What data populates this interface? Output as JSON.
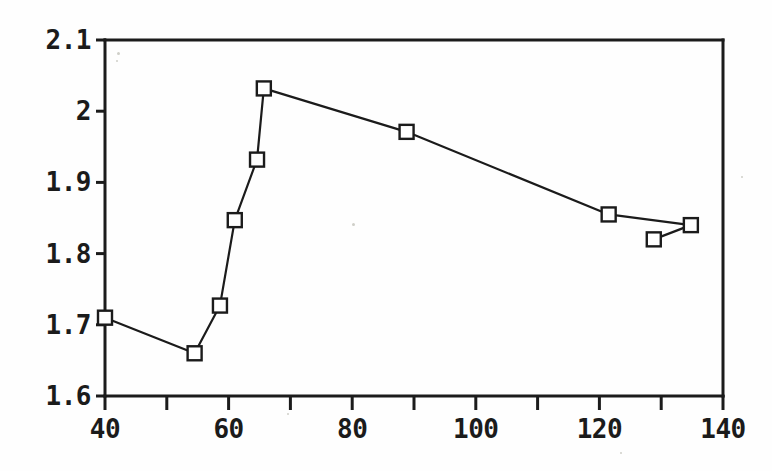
{
  "chart_data": {
    "type": "line",
    "title": "",
    "subtitle": "",
    "xlabel": "",
    "ylabel": "",
    "xlim": [
      40,
      140
    ],
    "ylim": [
      1.6,
      2.1
    ],
    "grid": false,
    "legend": null,
    "marker": "open-square",
    "line_color": "#1b1b1b",
    "marker_color": "#1b1b1b",
    "background_color": "#ffffff",
    "x_ticks": [
      40,
      60,
      80,
      100,
      120,
      140
    ],
    "x_tick_labels": [
      "40",
      "60",
      "80",
      "100",
      "120",
      "140"
    ],
    "x_minor_ticks": [
      50,
      70,
      90,
      110,
      130
    ],
    "y_ticks": [
      1.6,
      1.7,
      1.8,
      1.9,
      2.0,
      2.1
    ],
    "y_tick_labels": [
      "1.6",
      "1.7",
      "1.8",
      "1.9",
      "2",
      "2.1"
    ],
    "series": [
      {
        "name": "series-1",
        "points": [
          {
            "x": 40.0,
            "y": 1.71
          },
          {
            "x": 54.5,
            "y": 1.66
          },
          {
            "x": 58.6,
            "y": 1.727
          },
          {
            "x": 61.0,
            "y": 1.847
          },
          {
            "x": 64.6,
            "y": 1.932
          },
          {
            "x": 65.7,
            "y": 2.032
          },
          {
            "x": 88.8,
            "y": 1.971
          },
          {
            "x": 121.5,
            "y": 1.855
          },
          {
            "x": 134.8,
            "y": 1.84
          }
        ]
      },
      {
        "name": "series-1-branch",
        "points": [
          {
            "x": 128.8,
            "y": 1.82
          },
          {
            "x": 134.8,
            "y": 1.84
          }
        ]
      }
    ]
  },
  "plot": {
    "area_px": {
      "left": 105,
      "top": 40,
      "right": 723,
      "bottom": 396
    },
    "frame_color": "#1b1b1b",
    "frame_width": 3
  },
  "speckles": [
    {
      "x": 117,
      "y": 52,
      "size": 3
    },
    {
      "x": 116,
      "y": 60,
      "size": 2
    },
    {
      "x": 352,
      "y": 223,
      "size": 3
    },
    {
      "x": 287,
      "y": 413,
      "size": 2
    },
    {
      "x": 620,
      "y": 452,
      "size": 2
    },
    {
      "x": 741,
      "y": 176,
      "size": 2
    }
  ]
}
